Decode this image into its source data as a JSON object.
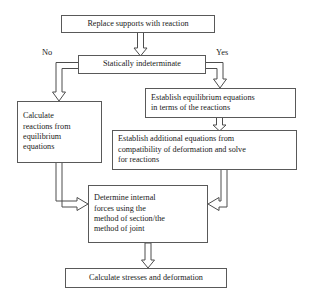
{
  "diagram": {
    "background_color": "#ffffff",
    "box_border_color": "#595959",
    "arrow_color": "#4d4d4d",
    "text_color": "#1a1a1a"
  },
  "nodes": [
    {
      "id": "replace-supports",
      "text": "Replace supports with reaction",
      "align": "center"
    },
    {
      "id": "statically-indeterminate",
      "text": "Statically indeterminate",
      "align": "center"
    },
    {
      "id": "calculate-reactions",
      "text": "Calculate\nreactions from\nequilibrium\nequations",
      "align": "left"
    },
    {
      "id": "establish-equilibrium",
      "text": "Establish equilibrium equations\nin terms of the reactions",
      "align": "left"
    },
    {
      "id": "establish-additional",
      "text": "Establish additional equations from\ncompatibility of deformation and solve\nfor reactions",
      "align": "left"
    },
    {
      "id": "determine-internal-forces",
      "text": "Determine internal\nforces using the\nmethod of section/the\nmethod of joint",
      "align": "left"
    },
    {
      "id": "calculate-stresses",
      "text": "Calculate stresses and deformation",
      "align": "center"
    }
  ],
  "branch_labels": {
    "no": "No",
    "yes": "Yes"
  },
  "edges": [
    {
      "id": "replace-to-decision",
      "from": "replace-supports",
      "to": "statically-indeterminate",
      "label": ""
    },
    {
      "id": "decision-no-to-calculate",
      "from": "statically-indeterminate",
      "to": "calculate-reactions",
      "label": "No"
    },
    {
      "id": "decision-yes-to-establish",
      "from": "statically-indeterminate",
      "to": "establish-equilibrium",
      "label": "Yes"
    },
    {
      "id": "establish-to-additional",
      "from": "establish-equilibrium",
      "to": "establish-additional",
      "label": ""
    },
    {
      "id": "calculate-to-determine",
      "from": "calculate-reactions",
      "to": "determine-internal-forces",
      "label": ""
    },
    {
      "id": "additional-to-determine",
      "from": "establish-additional",
      "to": "determine-internal-forces",
      "label": ""
    },
    {
      "id": "determine-to-stresses",
      "from": "determine-internal-forces",
      "to": "calculate-stresses",
      "label": ""
    }
  ]
}
